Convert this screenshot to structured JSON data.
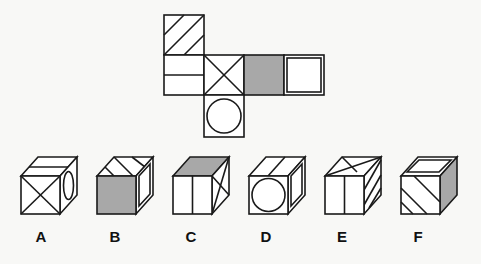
{
  "puzzle": {
    "type": "cube-net-folding",
    "net": {
      "faces": [
        {
          "position": "top-left",
          "pattern": "diagonal-stripes"
        },
        {
          "position": "middle-left",
          "pattern": "horizontal-line"
        },
        {
          "position": "middle",
          "pattern": "x-cross"
        },
        {
          "position": "middle-right",
          "pattern": "gray-fill"
        },
        {
          "position": "far-right",
          "pattern": "square-in-square"
        },
        {
          "position": "bottom",
          "pattern": "circle"
        }
      ]
    },
    "options": [
      {
        "label": "A",
        "front": "x-cross",
        "top": "horizontal-line",
        "right": "circle"
      },
      {
        "label": "B",
        "front": "gray-fill",
        "top": "diagonal-stripes",
        "right": "square-in-square"
      },
      {
        "label": "C",
        "front": "vertical-line",
        "top": "gray-fill",
        "right": "x-cross"
      },
      {
        "label": "D",
        "front": "circle",
        "top": "center-line",
        "right": "square-in-square"
      },
      {
        "label": "E",
        "front": "vertical-line",
        "top": "x-cross",
        "right": "diagonal-stripes"
      },
      {
        "label": "F",
        "front": "diagonal-stripes",
        "top": "square-in-square",
        "right": "gray-fill"
      }
    ]
  },
  "colors": {
    "line": "#1a1a1a",
    "gray": "#a8a8a8",
    "background": "#f8f8f6"
  }
}
